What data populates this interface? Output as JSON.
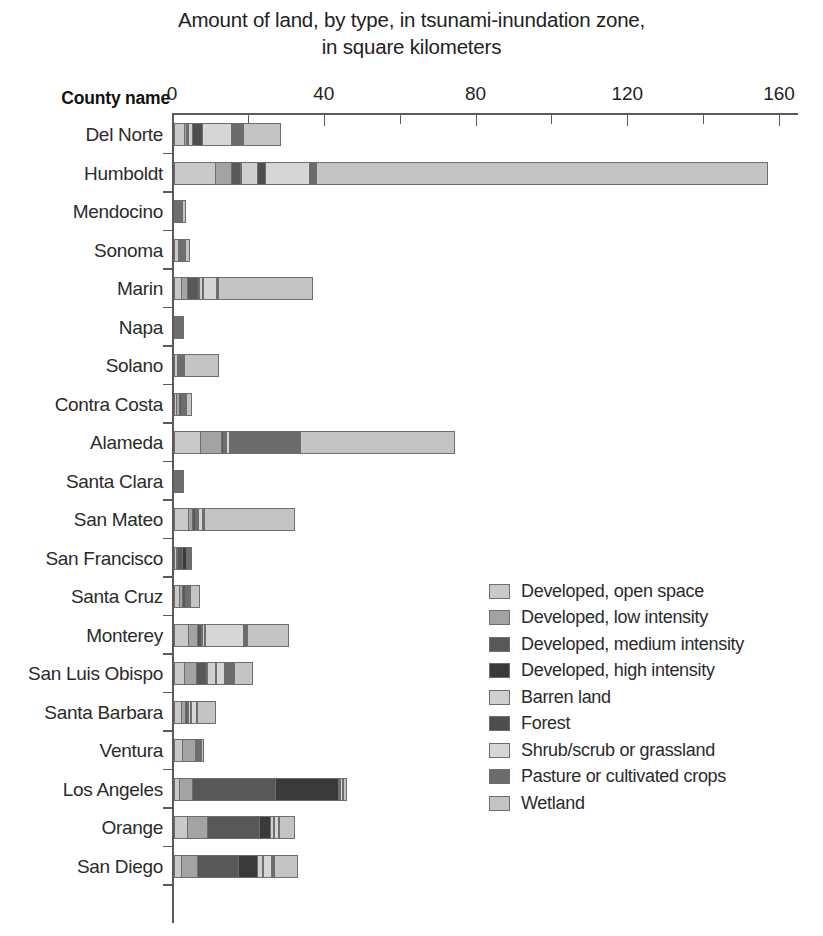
{
  "chart_data": {
    "type": "bar",
    "orientation": "horizontal",
    "stacked": true,
    "title": "Amount of land, by type, in tsunami-inundation zone, in square kilometers",
    "title_line1": "Amount of land, by type, in tsunami-inundation zone,",
    "title_line2": "in square kilometers",
    "xlabel": "",
    "ylabel": "County name",
    "xlim": [
      0,
      165
    ],
    "xticks": [
      0,
      20,
      40,
      60,
      80,
      100,
      120,
      140,
      160
    ],
    "xtick_labels": [
      "0",
      "",
      "40",
      "",
      "80",
      "",
      "120",
      "",
      "160"
    ],
    "grid": false,
    "legend_position": "center-right",
    "categories": [
      "Del Norte",
      "Humboldt",
      "Mendocino",
      "Sonoma",
      "Marin",
      "Napa",
      "Solano",
      "Contra Costa",
      "Alameda",
      "Santa Clara",
      "San Mateo",
      "San Francisco",
      "Santa Cruz",
      "Monterey",
      "San Luis Obispo",
      "Santa Barbara",
      "Ventura",
      "Los Angeles",
      "Orange",
      "San Diego"
    ],
    "series": [
      {
        "name": "Developed, open space",
        "color": "#c9c9c9",
        "values": [
          3.0,
          11.0,
          0.6,
          1.3,
          2.0,
          1.5,
          1.0,
          0.8,
          7.0,
          0.6,
          4.0,
          0.8,
          1.5,
          4.0,
          2.8,
          2.0,
          2.4,
          1.6,
          3.6,
          2.0
        ]
      },
      {
        "name": "Developed, low intensity",
        "color": "#a3a3a3",
        "values": [
          0.6,
          4.5,
          0.5,
          0.6,
          2.0,
          0.2,
          0.3,
          1.0,
          6.0,
          0.3,
          1.4,
          0.6,
          1.2,
          2.6,
          3.4,
          1.4,
          3.6,
          3.8,
          5.6,
          4.6
        ]
      },
      {
        "name": "Developed, medium intensity",
        "color": "#585858",
        "values": [
          0.6,
          2.6,
          0.4,
          0.3,
          3.2,
          0.1,
          0.2,
          0.8,
          0.6,
          0.2,
          1.0,
          1.4,
          1.0,
          1.4,
          3.0,
          0.9,
          0.4,
          22.0,
          14.0,
          11.0
        ]
      },
      {
        "name": "Developed, high intensity",
        "color": "#3a3a3a",
        "values": [
          0.3,
          0.3,
          0.2,
          0.2,
          0.4,
          0.05,
          0.1,
          0.2,
          0.3,
          0.1,
          0.4,
          1.3,
          0.3,
          0.5,
          0.5,
          0.3,
          0.2,
          17.0,
          3.2,
          5.4
        ]
      },
      {
        "name": "Barren land",
        "color": "#cfcfcf",
        "values": [
          1.4,
          4.6,
          0.3,
          0.3,
          0.9,
          0.1,
          0.2,
          0.3,
          0.6,
          0.1,
          0.5,
          0.2,
          0.3,
          0.6,
          2.3,
          0.8,
          0.3,
          0.5,
          0.9,
          1.6
        ]
      },
      {
        "name": "Forest",
        "color": "#4e4e4e",
        "values": [
          2.8,
          2.3,
          0.3,
          0.2,
          0.6,
          0.05,
          0.1,
          0.2,
          0.4,
          0.1,
          0.4,
          0.2,
          0.3,
          0.3,
          0.5,
          0.4,
          0.2,
          0.3,
          0.4,
          0.5
        ]
      },
      {
        "name": "Shrub/scrub or grassland",
        "color": "#d6d6d6",
        "values": [
          8.0,
          12.0,
          0.5,
          0.6,
          3.6,
          0.2,
          0.4,
          0.5,
          1.0,
          0.3,
          1.2,
          0.4,
          0.6,
          10.5,
          2.6,
          1.4,
          0.4,
          0.6,
          1.5,
          2.4
        ]
      },
      {
        "name": "Pasture or cultivated crops",
        "color": "#6b6b6b",
        "values": [
          3.4,
          2.1,
          0.2,
          0.2,
          1.0,
          0.1,
          0.2,
          0.3,
          19.0,
          0.2,
          0.8,
          0.2,
          0.3,
          1.2,
          2.8,
          0.6,
          0.3,
          0.4,
          0.6,
          0.9
        ]
      },
      {
        "name": "Wetland",
        "color": "#c4c4c4",
        "values": [
          10.0,
          119.0,
          1.0,
          1.3,
          25.0,
          0.4,
          9.4,
          1.5,
          41.0,
          0.5,
          24.0,
          0.4,
          2.5,
          11.0,
          5.0,
          5.0,
          0.8,
          1.2,
          4.0,
          6.5
        ]
      }
    ],
    "totals": [
      30.1,
      158.4,
      4.0,
      4.7,
      38.7,
      2.6,
      11.9,
      5.6,
      75.9,
      2.4,
      33.7,
      5.5,
      8.0,
      32.1,
      22.9,
      12.8,
      8.6,
      47.4,
      33.8,
      34.9
    ]
  },
  "axis": {
    "y_axis_title": "County name",
    "x_tick_labels": [
      "0",
      "40",
      "80",
      "120",
      "160"
    ],
    "x_tick_values": [
      0,
      40,
      80,
      120,
      160
    ]
  },
  "legend": {
    "items": [
      {
        "label": "Developed, open space",
        "color": "#c9c9c9"
      },
      {
        "label": "Developed, low intensity",
        "color": "#a3a3a3"
      },
      {
        "label": "Developed, medium intensity",
        "color": "#585858"
      },
      {
        "label": "Developed, high intensity",
        "color": "#3a3a3a"
      },
      {
        "label": "Barren land",
        "color": "#cfcfcf"
      },
      {
        "label": "Forest",
        "color": "#4e4e4e"
      },
      {
        "label": "Shrub/scrub or grassland",
        "color": "#d6d6d6"
      },
      {
        "label": "Pasture or cultivated crops",
        "color": "#6b6b6b"
      },
      {
        "label": "Wetland",
        "color": "#c4c4c4"
      }
    ]
  }
}
